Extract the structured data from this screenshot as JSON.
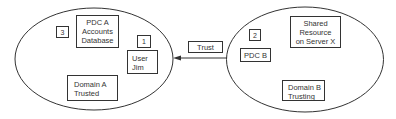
{
  "diagram": {
    "domain_a": {
      "label_lines": [
        "Domain A",
        "Trusted"
      ],
      "pdc": {
        "lines": [
          "PDC A",
          "Accounts",
          "Database"
        ]
      },
      "pdc_step": "3",
      "user": {
        "lines": [
          "User",
          "Jim"
        ]
      },
      "user_step": "1"
    },
    "domain_b": {
      "label_lines": [
        "Domain B",
        "Trusting"
      ],
      "pdc": {
        "lines": [
          "PDC B"
        ]
      },
      "pdc_step": "2",
      "resource": {
        "lines": [
          "Shared",
          "Resource",
          "on Server X"
        ]
      }
    },
    "trust": {
      "label": "Trust",
      "direction": "Domain B to Domain A"
    }
  }
}
